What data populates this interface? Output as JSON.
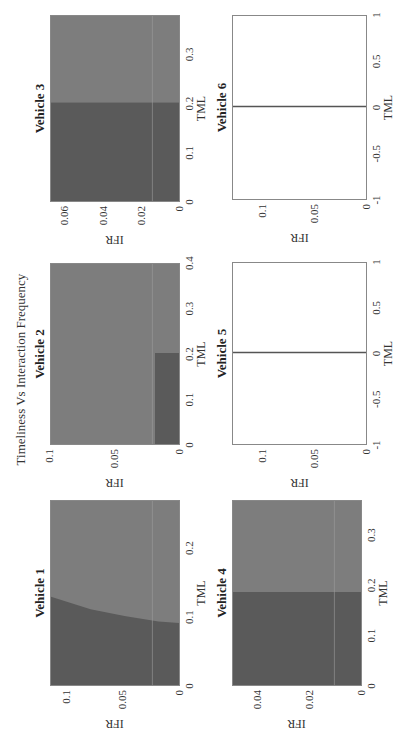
{
  "figure": {
    "title": "Timeliness Vs Interaction Frequency",
    "rotation_deg": -90
  },
  "colors": {
    "dark_region": "#5a5a5a",
    "light_region": "#7d7d7d",
    "empty_bg": "#ffffff",
    "line": "#555555",
    "gridline": "#9a9a9a"
  },
  "chart_data": [
    {
      "type": "heatmap",
      "title": "Vehicle 1",
      "xlabel": "TML",
      "ylabel": "IFR",
      "xlim": [
        0,
        0.27
      ],
      "ylim": [
        0,
        0.115
      ],
      "xticks": [
        "0",
        "0.1",
        "0.2"
      ],
      "yticks": [
        "0",
        "0.05",
        "0.1"
      ],
      "regions": "dark region for TML below a curved boundary from ~0.13 at IFR=0.115 to ~0.09 at IFR=0; light elsewhere",
      "boundary": [
        [
          0.128,
          0.115
        ],
        [
          0.11,
          0.08
        ],
        [
          0.1,
          0.05
        ],
        [
          0.092,
          0.02
        ],
        [
          0.09,
          0.0
        ]
      ]
    },
    {
      "type": "heatmap",
      "title": "Vehicle 2",
      "xlabel": "TML",
      "ylabel": "IFR",
      "xlim": [
        0,
        0.4
      ],
      "ylim": [
        0,
        0.1
      ],
      "xticks": [
        "0",
        "0.1",
        "0.2",
        "0.3",
        "0.4"
      ],
      "yticks": [
        "0",
        "0.05",
        "0.1"
      ],
      "regions": "dark rectangle for TML 0-0.2 and IFR 0-0.02; light elsewhere",
      "dark_rect": {
        "tml": [
          0,
          0.2
        ],
        "ifr": [
          0,
          0.02
        ]
      }
    },
    {
      "type": "heatmap",
      "title": "Vehicle 3",
      "xlabel": "TML",
      "ylabel": "IFR",
      "xlim": [
        0,
        0.38
      ],
      "ylim": [
        0,
        0.068
      ],
      "xticks": [
        "0",
        "0.1",
        "0.2",
        "0.3"
      ],
      "yticks": [
        "0",
        "0.02",
        "0.04",
        "0.06"
      ],
      "regions": "dark for TML 0-0.2 (all IFR); light for TML > 0.2",
      "split_tml": 0.2
    },
    {
      "type": "heatmap",
      "title": "Vehicle 4",
      "xlabel": "TML",
      "ylabel": "IFR",
      "xlim": [
        0,
        0.37
      ],
      "ylim": [
        0,
        0.05
      ],
      "xticks": [
        "0",
        "0.1",
        "0.2",
        "0.3"
      ],
      "yticks": [
        "0",
        "0.02",
        "0.04"
      ],
      "regions": "dark for TML 0-0.185 (all IFR); light for TML > 0.185",
      "split_tml": 0.185
    },
    {
      "type": "line",
      "title": "Vehicle 5",
      "xlabel": "TML",
      "ylabel": "IFR",
      "xlim": [
        -1,
        1
      ],
      "ylim": [
        0,
        0.13
      ],
      "xticks": [
        "-1",
        "-0.5",
        "0",
        "0.5",
        "1"
      ],
      "yticks": [
        "0",
        "0.05",
        "0.1"
      ],
      "series": [
        {
          "name": "TML=0",
          "x": [
            0,
            0
          ],
          "y": [
            0,
            0.13
          ]
        }
      ]
    },
    {
      "type": "line",
      "title": "Vehicle 6",
      "xlabel": "TML",
      "ylabel": "IFR",
      "xlim": [
        -1,
        1
      ],
      "ylim": [
        0,
        0.13
      ],
      "xticks": [
        "-1",
        "-0.5",
        "0",
        "0.5",
        "1"
      ],
      "yticks": [
        "0",
        "0.05",
        "0.1"
      ],
      "series": [
        {
          "name": "TML=0",
          "x": [
            0,
            0
          ],
          "y": [
            0,
            0.13
          ]
        }
      ]
    }
  ]
}
